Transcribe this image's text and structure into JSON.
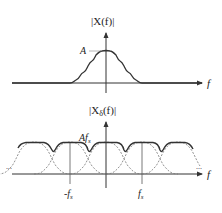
{
  "top_plot": {
    "y_label": "|X(f)|",
    "x_label": "f",
    "peak_label": "A",
    "description": "Continuous-time spectrum: bandlimited bump with ripples centered at f=0"
  },
  "bottom_plot": {
    "y_label": "|X",
    "y_label_sub": "δ",
    "y_label_tail": "(f)|",
    "x_label": "f",
    "peak_label": "Af",
    "peak_label_sub": "s",
    "tick_neg": "-f",
    "tick_neg_sub": "s",
    "tick_pos": "f",
    "tick_pos_sub": "s",
    "ellipsis_left": "...",
    "ellipsis_right": "...",
    "description": "Sampled spectrum: shifted replicas (dashed) overlap; solid line is sum showing aliasing"
  },
  "colors": {
    "axis": "#333333",
    "curve": "#333333",
    "replica": "#777777"
  }
}
